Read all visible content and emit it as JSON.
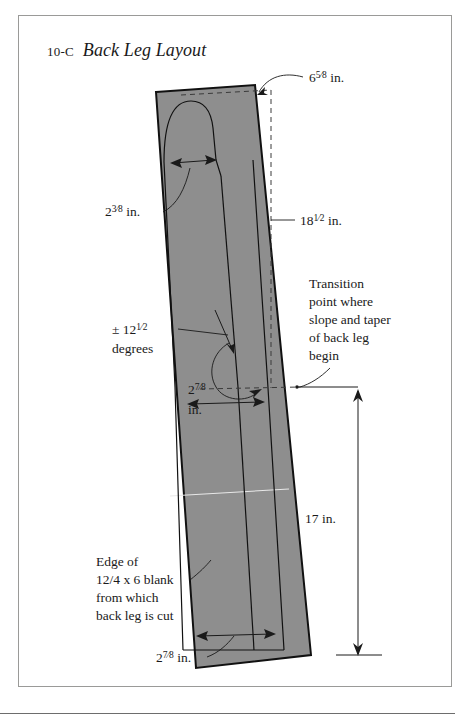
{
  "figure": {
    "number": "10-C",
    "title": "Back Leg Layout"
  },
  "labels": {
    "top_width": {
      "whole": "6",
      "fraction": "5/8",
      "unit": "in.",
      "text": "6 5/8 in."
    },
    "upper_left_width": {
      "whole": "2",
      "fraction": "3/8",
      "unit": "in.",
      "text": "2 3/8 in."
    },
    "upper_length": {
      "whole": "18",
      "fraction": "1/2",
      "unit": "in.",
      "text": "18 1/2 in."
    },
    "angle": {
      "text": "± 12",
      "fraction": "1/2",
      "second_line": "degrees",
      "full": "± 12 1/2 degrees"
    },
    "mid_width": {
      "whole": "2",
      "fraction": "7/8",
      "second_line": "in.",
      "text": "2 7/8 in."
    },
    "lower_length": {
      "text": "17 in."
    },
    "bottom_width": {
      "whole": "2",
      "fraction": "7/8",
      "unit": "in.",
      "text": "2 7/8 in."
    },
    "transition_note": {
      "lines": [
        "Transition",
        "point where",
        "slope and taper",
        "of back leg",
        "begin"
      ],
      "line1": "Transition",
      "line2": "point where",
      "line3": "slope and taper",
      "line4": "of back leg",
      "line5": "begin"
    },
    "blank_note": {
      "lines": [
        "Edge of",
        "12/4 x 6 blank",
        "from which",
        "back leg is cut"
      ],
      "line1": "Edge of",
      "line2": "12/4 x 6 blank",
      "line3": "from which",
      "line4": "back leg is cut"
    }
  },
  "colors": {
    "blank_fill": "#8e8e8e",
    "outline": "#111111",
    "frame_border": "#9a9a98",
    "page_background": "#ffffff",
    "text": "#1a1a1a"
  }
}
